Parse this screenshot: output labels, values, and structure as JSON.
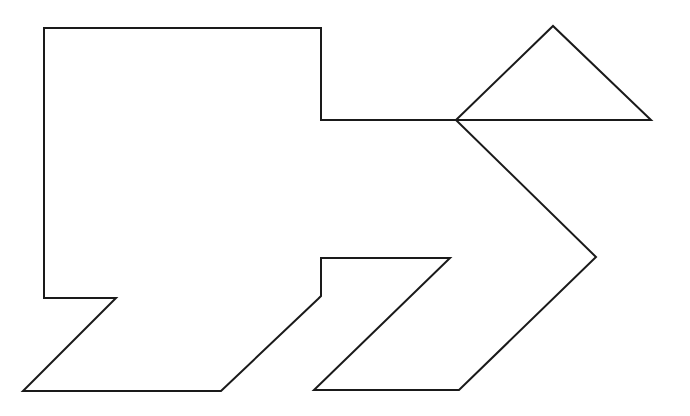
{
  "figure": {
    "type": "tangram-outline",
    "background": "#ffffff",
    "stroke_color": "#1a1a1a",
    "stroke_width": 2,
    "shapes": [
      {
        "name": "main-body-outline",
        "points": [
          [
            44,
            28
          ],
          [
            321,
            28
          ],
          [
            321,
            120
          ],
          [
            456,
            120
          ],
          [
            596,
            257
          ],
          [
            459,
            390
          ],
          [
            314,
            390
          ],
          [
            450,
            258
          ],
          [
            321,
            258
          ],
          [
            321,
            296
          ],
          [
            318,
            299
          ],
          [
            221,
            391
          ],
          [
            23,
            391
          ],
          [
            116,
            298
          ],
          [
            44,
            298
          ]
        ]
      },
      {
        "name": "top-triangle",
        "points": [
          [
            456,
            120
          ],
          [
            553,
            26
          ],
          [
            651,
            120
          ]
        ]
      }
    ]
  }
}
